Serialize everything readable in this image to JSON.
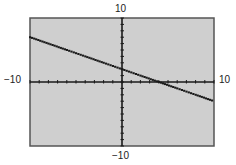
{
  "chart_data": {
    "type": "line",
    "title": "",
    "xlabel": "",
    "ylabel": "",
    "xlim": [
      -10,
      10
    ],
    "ylim": [
      -10,
      10
    ],
    "grid": false,
    "tick_labels": {
      "x_min": "−10",
      "x_max": "10",
      "y_min": "−10",
      "y_max": "10"
    },
    "x_tick_step": 1,
    "y_tick_step": 1,
    "series": [
      {
        "name": "line",
        "equation": "y = -0.5x + 2",
        "x": [
          -10,
          -8,
          -6,
          -4,
          -2,
          0,
          2,
          4,
          6,
          8,
          10
        ],
        "y": [
          7,
          6,
          5,
          4,
          3,
          2,
          1,
          0,
          -1,
          -2,
          -3
        ]
      }
    ],
    "annotations": [],
    "style": "graphing calculator screen, dotted pixel line"
  },
  "colors": {
    "screen_bg": "#cfcfcf",
    "screen_border": "#555555",
    "axis": "#1a1a1a",
    "line": "#1a1a1a"
  }
}
